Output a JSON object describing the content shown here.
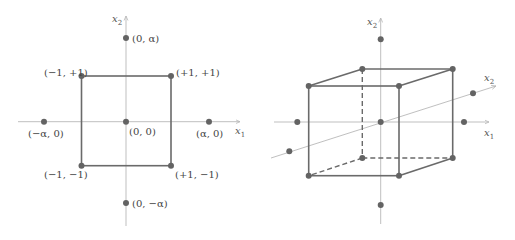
{
  "figure_2d": {
    "axis_x_label": "x",
    "axis_x_sub": "1",
    "axis_y_label": "x",
    "axis_y_sub": "2",
    "points": [
      {
        "label": "(0, α)",
        "role": "axial-point"
      },
      {
        "label": "(−1, +1)",
        "role": "factorial-point"
      },
      {
        "label": "(+1, +1)",
        "role": "factorial-point"
      },
      {
        "label": "(−α, 0)",
        "role": "axial-point"
      },
      {
        "label": "(0, 0)",
        "role": "center-point"
      },
      {
        "label": "(α, 0)",
        "role": "axial-point"
      },
      {
        "label": "(−1, −1)",
        "role": "factorial-point"
      },
      {
        "label": "(+1, −1)",
        "role": "factorial-point"
      },
      {
        "label": "(0, −α)",
        "role": "axial-point"
      }
    ]
  },
  "figure_3d": {
    "axis_x_label": "x",
    "axis_x_sub": "1",
    "axis_y_label": "x",
    "axis_y_sub": "2",
    "axis_z_label": "x",
    "axis_z_sub": "2"
  },
  "colors": {
    "axis": "#b8b8b8",
    "edge": "#6a6a6a",
    "point": "#636363",
    "label": "#444444"
  }
}
